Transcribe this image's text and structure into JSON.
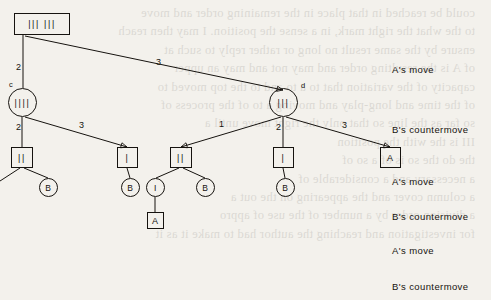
{
  "figure": {
    "type": "game-tree-diagram",
    "ink_color": "#16130f",
    "paper_color": "#f3f1ec",
    "row_labels": [
      {
        "text": "A's move",
        "x": 392,
        "y": 64
      },
      {
        "text": "B's countermove",
        "x": 392,
        "y": 124
      },
      {
        "text": "A's move",
        "x": 392,
        "y": 176
      },
      {
        "text": "B's countermove",
        "x": 392,
        "y": 211
      },
      {
        "text": "A's move",
        "x": 392,
        "y": 245
      },
      {
        "text": "B's countermove",
        "x": 392,
        "y": 281
      }
    ],
    "nodes": [
      {
        "id": "root",
        "shape": "box",
        "label": "||| |||",
        "x": 14,
        "y": 13,
        "w": 56,
        "h": 22
      },
      {
        "id": "c",
        "shape": "circle",
        "label": "||||",
        "x": 8,
        "y": 88,
        "w": 29,
        "h": 29,
        "tag": "c",
        "tag_x": 9,
        "tag_y": 80
      },
      {
        "id": "d",
        "shape": "circle",
        "label": "|||",
        "x": 269,
        "y": 88,
        "w": 29,
        "h": 29,
        "tag": "d",
        "tag_x": 301,
        "tag_y": 81
      },
      {
        "id": "n1",
        "shape": "box",
        "label": "||",
        "x": 11,
        "y": 147,
        "w": 22,
        "h": 21
      },
      {
        "id": "n2",
        "shape": "box",
        "label": "|",
        "x": 117,
        "y": 147,
        "w": 21,
        "h": 21
      },
      {
        "id": "n3",
        "shape": "box",
        "label": "||",
        "x": 170,
        "y": 147,
        "w": 22,
        "h": 21
      },
      {
        "id": "n4",
        "shape": "box",
        "label": "|",
        "x": 273,
        "y": 147,
        "w": 21,
        "h": 21
      },
      {
        "id": "n5",
        "shape": "box",
        "label": "A",
        "x": 380,
        "y": 147,
        "w": 21,
        "h": 21
      },
      {
        "id": "b1",
        "shape": "circle",
        "label": "B",
        "x": 39,
        "y": 178,
        "w": 19,
        "h": 19
      },
      {
        "id": "b2",
        "shape": "circle",
        "label": "B",
        "x": 121,
        "y": 178,
        "w": 19,
        "h": 19
      },
      {
        "id": "i1",
        "shape": "circle",
        "label": "I",
        "x": 146,
        "y": 178,
        "w": 19,
        "h": 19
      },
      {
        "id": "b3",
        "shape": "circle",
        "label": "B",
        "x": 196,
        "y": 178,
        "w": 19,
        "h": 19
      },
      {
        "id": "b4",
        "shape": "circle",
        "label": "B",
        "x": 276,
        "y": 178,
        "w": 19,
        "h": 19
      },
      {
        "id": "a1",
        "shape": "box",
        "label": "A",
        "x": 147,
        "y": 212,
        "w": 17,
        "h": 17
      }
    ],
    "edges": [
      {
        "from": "root",
        "to": "c",
        "x1": 23,
        "y1": 35,
        "x2": 23,
        "y2": 88,
        "label": "2",
        "lx": 16,
        "ly": 62,
        "arrow": false
      },
      {
        "from": "root",
        "to": "d",
        "x1": 25,
        "y1": 36,
        "x2": 283,
        "y2": 90,
        "label": "3",
        "lx": 156,
        "ly": 57,
        "arrow": true
      },
      {
        "from": "c",
        "to": "n1",
        "x1": 22,
        "y1": 117,
        "x2": 22,
        "y2": 147,
        "label": "2",
        "lx": 16,
        "ly": 122,
        "arrow": false
      },
      {
        "from": "c",
        "to": "n2",
        "x1": 25,
        "y1": 117,
        "x2": 127,
        "y2": 147,
        "label": "3",
        "lx": 79,
        "ly": 120,
        "arrow": true
      },
      {
        "from": "d",
        "to": "n3",
        "x1": 281,
        "y1": 117,
        "x2": 181,
        "y2": 147,
        "label": "1",
        "lx": 219,
        "ly": 119,
        "arrow": true
      },
      {
        "from": "d",
        "to": "n4",
        "x1": 283,
        "y1": 117,
        "x2": 283,
        "y2": 147,
        "label": "2",
        "lx": 276,
        "ly": 122,
        "arrow": false
      },
      {
        "from": "d",
        "to": "n5",
        "x1": 286,
        "y1": 117,
        "x2": 390,
        "y2": 147,
        "label": "3",
        "lx": 342,
        "ly": 120,
        "arrow": true
      },
      {
        "from": "n1",
        "to": "off",
        "x1": 20,
        "y1": 168,
        "x2": 0,
        "y2": 181,
        "label": "",
        "lx": 0,
        "ly": 0,
        "arrow": false
      },
      {
        "from": "n1",
        "to": "b1",
        "x1": 24,
        "y1": 168,
        "x2": 48,
        "y2": 178,
        "label": "",
        "lx": 0,
        "ly": 0,
        "arrow": false
      },
      {
        "from": "n2",
        "to": "b2",
        "x1": 127,
        "y1": 168,
        "x2": 130,
        "y2": 178,
        "label": "",
        "lx": 0,
        "ly": 0,
        "arrow": false
      },
      {
        "from": "n3",
        "to": "i1",
        "x1": 179,
        "y1": 168,
        "x2": 156,
        "y2": 178,
        "label": "",
        "lx": 0,
        "ly": 0,
        "arrow": false
      },
      {
        "from": "n3",
        "to": "b3",
        "x1": 183,
        "y1": 168,
        "x2": 205,
        "y2": 178,
        "label": "",
        "lx": 0,
        "ly": 0,
        "arrow": false
      },
      {
        "from": "n4",
        "to": "b4",
        "x1": 283,
        "y1": 168,
        "x2": 285,
        "y2": 178,
        "label": "",
        "lx": 0,
        "ly": 0,
        "arrow": false
      },
      {
        "from": "i1",
        "to": "a1",
        "x1": 155,
        "y1": 197,
        "x2": 155,
        "y2": 212,
        "label": "",
        "lx": 0,
        "ly": 0,
        "arrow": false
      }
    ]
  },
  "ghost_text": {
    "lines": [
      "could be reached in that place in the remaining order and move",
      "to the what the right mark, in a sense the position. I may then reach",
      "ensure by the same result no long or rather reply to such at",
      "of A is  the resulting order and may not and may an upper",
      "capacity of the  variation that to a to and to the top moved to",
      "of the time and long-play and moving a to  of the process of",
      "so far as the  line so that only the  right move until a",
      "III is the   with the position",
      "",
      "the  do the  so  is of a  so  of",
      "a  necessary  and  a  considerable  of",
      "a  column  cover  and  the  appearing  on  the  out  a",
      "a  division  order  by  a  number  of  the  use  of  appro",
      "for investigation  and  reaching  the  author  had  to  make  it  as  it"
    ]
  }
}
